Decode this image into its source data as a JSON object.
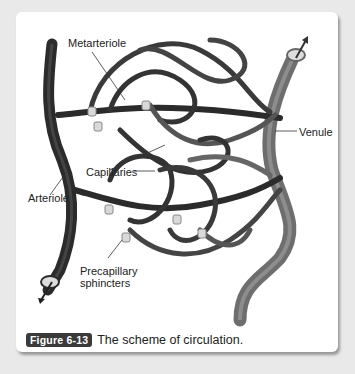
{
  "figure": {
    "labels": {
      "metarteriole": "Metarteriole",
      "venule": "Venule",
      "capillaries": "Capillaries",
      "arteriole": "Arteriole",
      "precapillary_line1": "Precapillary",
      "precapillary_line2": "sphincters"
    },
    "caption": {
      "badge": "Figure 6-13",
      "text": "The scheme of circulation."
    },
    "colors": {
      "vessel_dark": "#2b2b2b",
      "vessel_light": "#6e6e6e",
      "sphincter": "#d9d9d9",
      "badge_bg": "#3a3a3a"
    }
  }
}
